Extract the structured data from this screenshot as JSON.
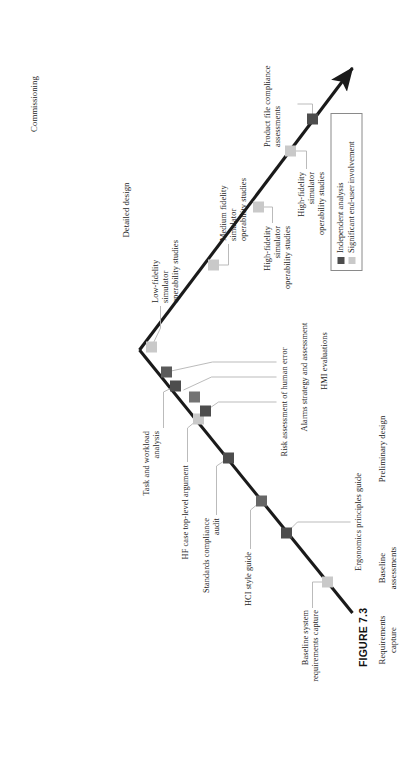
{
  "figure": {
    "caption": "FIGURE 7.3",
    "colors": {
      "line": "#1a1a1a",
      "independent_analysis": "#4d4d4d",
      "end_user_involvement": "#c9c9c9",
      "leader_line": "#b3b3b3",
      "legend_border": "#8a8a8a",
      "background": "#ffffff"
    }
  },
  "legend": {
    "items": [
      {
        "label": "Independent analysis",
        "swatch": "#4d4d4d",
        "key": "independent-analysis"
      },
      {
        "label": "Significant end-user involvement",
        "swatch": "#c9c9c9",
        "key": "end-user-involvement"
      }
    ]
  },
  "stages": [
    {
      "key": "requirements-capture",
      "label": "Requirements\ncapture"
    },
    {
      "key": "baseline-assessments",
      "label": "Baseline\nassessments"
    },
    {
      "key": "preliminary-design",
      "label": "Preliminary design"
    },
    {
      "key": "detailed-design",
      "label": "Detailed design"
    },
    {
      "key": "commissioning",
      "label": "Commissioning"
    }
  ],
  "annotations": [
    {
      "key": "baseline-system-requirements-capture",
      "label": "Baseline system\nrequirements capture"
    },
    {
      "key": "hci-style-guide",
      "label": "HCI style guide"
    },
    {
      "key": "ergonomics-principles-guide",
      "label": "Ergonomics principles guide"
    },
    {
      "key": "standards-compliance-audit",
      "label": "Standards compliance\naudit"
    },
    {
      "key": "hf-case-top-level-argument",
      "label": "HF case top-level argument"
    },
    {
      "key": "task-and-workload-analysis",
      "label": "Task and workload\nanalysis"
    },
    {
      "key": "risk-assessment-of-human-error",
      "label": "Risk assessment of human error"
    },
    {
      "key": "alarms-strategy-and-assessment",
      "label": "Alarms strategy and assessment"
    },
    {
      "key": "hmi-evaluations",
      "label": "HMI evaluations"
    },
    {
      "key": "low-fidelity-simulator-operability-studies",
      "label": "Low-fidelity\nsimulator\noperability studies"
    },
    {
      "key": "medium-fidelity-simulator-operability-studies",
      "label": "Medium fidelity\nsimulator\noperability studies"
    },
    {
      "key": "high-fidelity-simulator-operability-studies-1",
      "label": "High-fidelity\nsimulator\noperability studies"
    },
    {
      "key": "high-fidelity-simulator-operability-studies-2",
      "label": "High-fidelity\nsimulator\noperability studies"
    },
    {
      "key": "product-file-compliance-assessments",
      "label": "Product file compliance\nassessments"
    }
  ],
  "markers": [
    {
      "key": "marker-baseline-requirements",
      "type": "end_user_involvement"
    },
    {
      "key": "marker-ergonomics-principles",
      "type": "independent_analysis"
    },
    {
      "key": "marker-hci-style-guide",
      "type": "independent_analysis"
    },
    {
      "key": "marker-standards-compliance",
      "type": "independent_analysis"
    },
    {
      "key": "marker-hf-case",
      "type": "end_user_involvement"
    },
    {
      "key": "marker-risk-assessment",
      "type": "independent_analysis"
    },
    {
      "key": "marker-alarms-strategy",
      "type": "independent_analysis"
    },
    {
      "key": "marker-task-workload",
      "type": "independent_analysis"
    },
    {
      "key": "marker-hmi-evaluations",
      "type": "independent_analysis"
    },
    {
      "key": "marker-low-fidelity",
      "type": "end_user_involvement"
    },
    {
      "key": "marker-medium-fidelity",
      "type": "end_user_involvement"
    },
    {
      "key": "marker-high-fidelity-1",
      "type": "end_user_involvement"
    },
    {
      "key": "marker-high-fidelity-2",
      "type": "end_user_involvement"
    },
    {
      "key": "marker-product-file",
      "type": "independent_analysis"
    }
  ]
}
